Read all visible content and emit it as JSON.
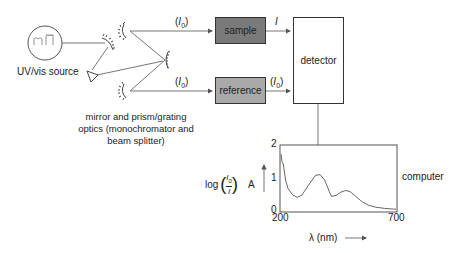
{
  "source": {
    "label": "UV/vis source"
  },
  "optics": {
    "caption_lines": [
      "mirror and prism/grating",
      "optics (monochromator and",
      "beam splitter)"
    ]
  },
  "beams": {
    "top_label": "(I0)",
    "bottom_label": "(I0)",
    "sample_out_label": "I",
    "reference_out_label": "(I0)"
  },
  "sample": {
    "label": "sample",
    "color": "#7a7a7a"
  },
  "reference": {
    "label": "reference",
    "color": "#a9a9a9"
  },
  "detector": {
    "label": "detector"
  },
  "computer": {
    "label": "computer"
  },
  "chart_data": {
    "type": "line",
    "title": "",
    "xlabel": "λ (nm)",
    "ylabel": "log(I0/I)  A",
    "x_ticks": [
      "200",
      "700"
    ],
    "y_ticks": [
      "0",
      "1",
      "2"
    ],
    "xlim": [
      200,
      700
    ],
    "ylim": [
      0,
      2
    ],
    "grid": false,
    "series": [
      {
        "name": "absorbance spectrum",
        "x": [
          200,
          205,
          210,
          215,
          220,
          230,
          250,
          270,
          290,
          320,
          350,
          370,
          390,
          410,
          420,
          440,
          460,
          480,
          500,
          520,
          550,
          580,
          610,
          650,
          690,
          700
        ],
        "values": [
          1.75,
          1.5,
          1.45,
          1.2,
          0.95,
          0.7,
          0.5,
          0.42,
          0.48,
          0.8,
          1.1,
          1.12,
          0.95,
          0.6,
          0.45,
          0.48,
          0.58,
          0.63,
          0.6,
          0.48,
          0.3,
          0.18,
          0.12,
          0.08,
          0.06,
          0.06
        ]
      }
    ]
  }
}
